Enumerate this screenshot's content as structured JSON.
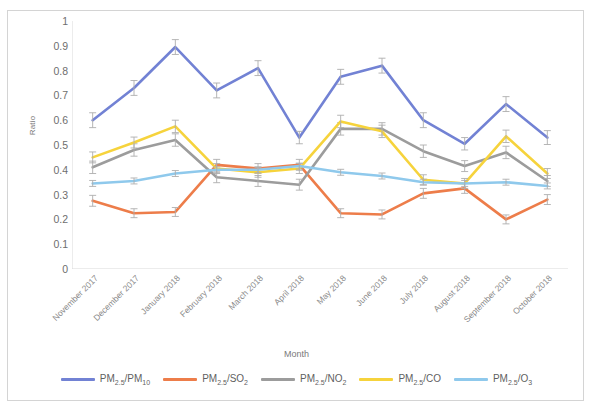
{
  "chart_data": {
    "type": "line",
    "title": "",
    "xlabel": "Month",
    "ylabel": "Ratio",
    "ylim": [
      0,
      1
    ],
    "ytick_step": 0.1,
    "grid": false,
    "legend_position": "bottom",
    "error_bars": true,
    "categories": [
      "November 2017",
      "December 2017",
      "January 2018",
      "February 2018",
      "March 2018",
      "April 2018",
      "May 2018",
      "June 2018",
      "July 2018",
      "August 2018",
      "September 2018",
      "October 2018"
    ],
    "ytick_labels": [
      "0",
      "0.1",
      "0.2",
      "0.3",
      "0.4",
      "0.5",
      "0.6",
      "0.7",
      "0.8",
      "0.9",
      "1"
    ],
    "series": [
      {
        "name": "PM2.5/PM10",
        "label_html": "PM<sub>2.5</sub>/PM<sub>10</sub>",
        "color": "#7282D4",
        "values": [
          0.6,
          0.73,
          0.895,
          0.72,
          0.81,
          0.53,
          0.775,
          0.82,
          0.6,
          0.505,
          0.665,
          0.53
        ],
        "errors": [
          0.03,
          0.03,
          0.03,
          0.03,
          0.03,
          0.025,
          0.03,
          0.03,
          0.03,
          0.025,
          0.03,
          0.028
        ]
      },
      {
        "name": "PM2.5/SO2",
        "label_html": "PM<sub>2.5</sub>/SO<sub>2</sub>",
        "color": "#ED7D4A",
        "values": [
          0.275,
          0.225,
          0.23,
          0.42,
          0.405,
          0.42,
          0.225,
          0.22,
          0.305,
          0.325,
          0.2,
          0.28
        ],
        "errors": [
          0.022,
          0.018,
          0.018,
          0.022,
          0.02,
          0.022,
          0.018,
          0.018,
          0.02,
          0.02,
          0.018,
          0.02
        ]
      },
      {
        "name": "PM2.5/NO2",
        "label_html": "PM<sub>2.5</sub>/NO<sub>2</sub>",
        "color": "#9C9C9C",
        "values": [
          0.41,
          0.48,
          0.52,
          0.37,
          0.355,
          0.34,
          0.565,
          0.565,
          0.475,
          0.415,
          0.47,
          0.355
        ],
        "errors": [
          0.025,
          0.025,
          0.025,
          0.022,
          0.022,
          0.022,
          0.025,
          0.025,
          0.025,
          0.022,
          0.025,
          0.022
        ]
      },
      {
        "name": "PM2.5/CO",
        "label_html": "PM<sub>2.5</sub>/CO",
        "color": "#F6D33C",
        "values": [
          0.45,
          0.51,
          0.575,
          0.405,
          0.39,
          0.405,
          0.595,
          0.555,
          0.36,
          0.345,
          0.535,
          0.385
        ],
        "errors": [
          0.022,
          0.022,
          0.025,
          0.02,
          0.02,
          0.02,
          0.025,
          0.025,
          0.02,
          0.02,
          0.025,
          0.02
        ]
      },
      {
        "name": "PM2.5/O3",
        "label_html": "PM<sub>2.5</sub>/O<sub>3</sub>",
        "color": "#8FC9EC",
        "values": [
          0.345,
          0.355,
          0.385,
          0.4,
          0.4,
          0.415,
          0.39,
          0.375,
          0.35,
          0.345,
          0.35,
          0.335
        ],
        "errors": [
          0.012,
          0.012,
          0.012,
          0.012,
          0.012,
          0.012,
          0.012,
          0.012,
          0.012,
          0.012,
          0.012,
          0.012
        ]
      }
    ]
  }
}
